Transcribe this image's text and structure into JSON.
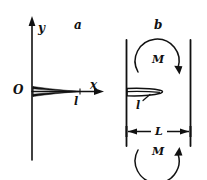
{
  "figure": {
    "kind": "line-diagram",
    "background_color": "#ffffff",
    "ink_color": "#111111",
    "panels": [
      {
        "id": "a",
        "label": "a",
        "description": "coordinate axes with thin wedge along x-axis",
        "axes": {
          "y_label": "y",
          "x_label": "x",
          "origin_label": "O"
        },
        "body_label": "l"
      },
      {
        "id": "b",
        "label": "b",
        "description": "two parallel plates with blade between them",
        "gap_label": "L",
        "body_label": "l",
        "moment_top_label": "M",
        "moment_bottom_label": "M"
      }
    ]
  },
  "labels": {
    "panel_a": "a",
    "panel_b": "b",
    "axis_y": "y",
    "axis_x": "x",
    "origin": "O",
    "body_a": "l",
    "body_b": "l",
    "gap": "L",
    "moment_top": "M",
    "moment_bottom": "M"
  },
  "colors": {
    "ink": "#111111",
    "background": "#ffffff"
  }
}
